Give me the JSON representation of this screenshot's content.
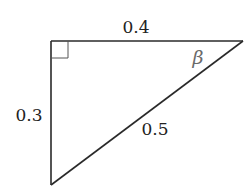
{
  "diagram": {
    "type": "right-triangle",
    "colors": {
      "stroke": "#2a2a2a",
      "label": "#222222",
      "angle_label": "#6a6a6a",
      "background": "#ffffff"
    },
    "vertices": {
      "right_angle": {
        "x": 51,
        "y": 41
      },
      "top_right": {
        "x": 243,
        "y": 41
      },
      "bottom": {
        "x": 51,
        "y": 185
      }
    },
    "sides": {
      "top": {
        "label": "0.4"
      },
      "left": {
        "label": "0.3"
      },
      "hypotenuse": {
        "label": "0.5"
      }
    },
    "angles": {
      "top_right": {
        "label": "β"
      },
      "top_left": {
        "marker": "right-angle-square"
      }
    }
  }
}
